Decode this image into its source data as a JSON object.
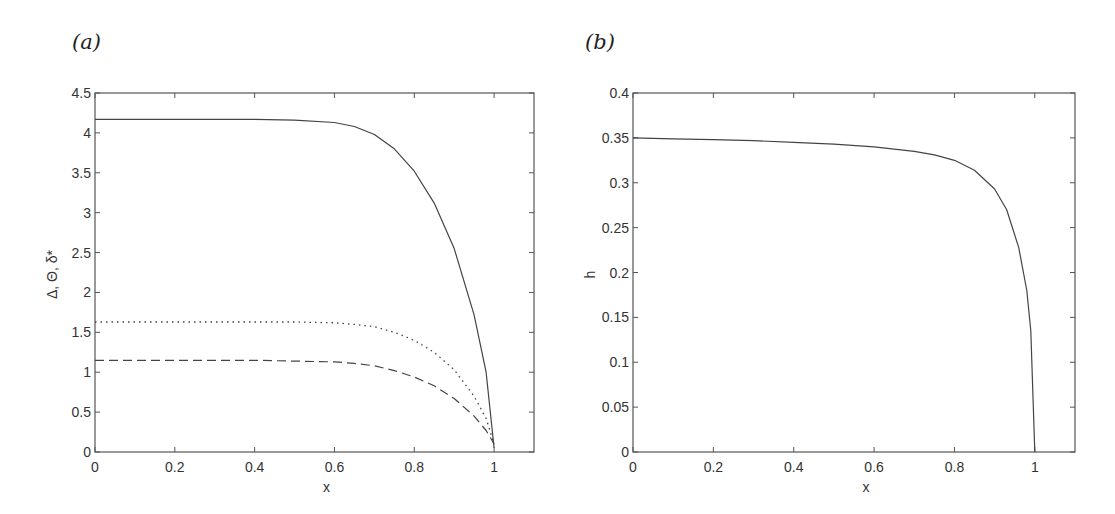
{
  "chart_data": [
    {
      "panel": "(a)",
      "type": "line",
      "title": "",
      "xlabel": "x",
      "ylabel": "Δ, Θ, δ*",
      "xlim": [
        0,
        1.1
      ],
      "ylim": [
        0,
        4.5
      ],
      "xticks": [
        "0",
        "0.2",
        "0.4",
        "0.6",
        "0.8",
        "1"
      ],
      "yticks": [
        "0",
        "0.5",
        "1",
        "1.5",
        "2",
        "2.5",
        "3",
        "3.5",
        "4",
        "4.5"
      ],
      "grid": false,
      "legend": null,
      "x": [
        0,
        0.1,
        0.2,
        0.3,
        0.4,
        0.5,
        0.6,
        0.65,
        0.7,
        0.75,
        0.8,
        0.85,
        0.9,
        0.95,
        0.98,
        1.0
      ],
      "series": [
        {
          "name": "solid",
          "style": "solid",
          "values": [
            4.17,
            4.17,
            4.17,
            4.17,
            4.17,
            4.16,
            4.13,
            4.08,
            3.98,
            3.8,
            3.52,
            3.12,
            2.55,
            1.72,
            1.0,
            0.05
          ]
        },
        {
          "name": "dotted",
          "style": "dotted",
          "values": [
            1.63,
            1.63,
            1.63,
            1.63,
            1.63,
            1.63,
            1.62,
            1.6,
            1.57,
            1.5,
            1.4,
            1.25,
            1.03,
            0.7,
            0.42,
            0.1
          ]
        },
        {
          "name": "dashed",
          "style": "dashed",
          "values": [
            1.15,
            1.15,
            1.15,
            1.15,
            1.15,
            1.14,
            1.13,
            1.11,
            1.08,
            1.02,
            0.94,
            0.83,
            0.67,
            0.45,
            0.27,
            0.1
          ]
        }
      ]
    },
    {
      "panel": "(b)",
      "type": "line",
      "title": "",
      "xlabel": "x",
      "ylabel": "h",
      "xlim": [
        0,
        1.1
      ],
      "ylim": [
        0,
        0.4
      ],
      "xticks": [
        "0",
        "0.2",
        "0.4",
        "0.6",
        "0.8",
        "1"
      ],
      "yticks": [
        "0",
        "0.05",
        "0.1",
        "0.15",
        "0.2",
        "0.25",
        "0.3",
        "0.35",
        "0.4"
      ],
      "grid": false,
      "legend": null,
      "x": [
        0,
        0.1,
        0.2,
        0.3,
        0.4,
        0.5,
        0.6,
        0.7,
        0.75,
        0.8,
        0.85,
        0.9,
        0.93,
        0.96,
        0.98,
        0.99,
        1.0
      ],
      "series": [
        {
          "name": "h",
          "style": "solid",
          "values": [
            0.35,
            0.349,
            0.348,
            0.347,
            0.345,
            0.343,
            0.34,
            0.335,
            0.331,
            0.325,
            0.314,
            0.293,
            0.27,
            0.228,
            0.18,
            0.135,
            0.0
          ]
        }
      ]
    }
  ],
  "panels": {
    "a": {
      "label": "(a)"
    },
    "b": {
      "label": "(b)"
    }
  }
}
